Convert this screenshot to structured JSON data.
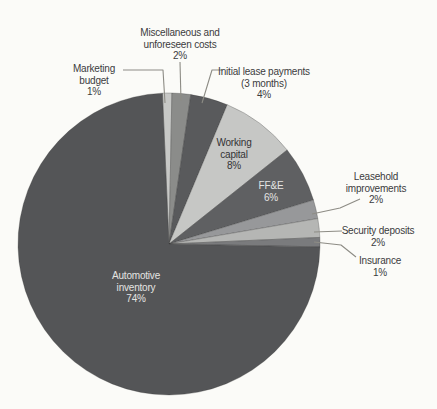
{
  "chart_data": {
    "type": "pie",
    "unit": "%",
    "start_angle_deg": -2.5,
    "direction": "clockwise",
    "total": 100,
    "slices": [
      {
        "name": "Marketing budget",
        "value": 1,
        "color": "#c7c8c6",
        "label_lines": [
          "Marketing",
          "budget",
          "1%"
        ]
      },
      {
        "name": "Miscellaneous and unforeseen costs",
        "value": 2,
        "color": "#8b8c8a",
        "label_lines": [
          "Miscellaneous and",
          "unforeseen costs",
          "2%"
        ]
      },
      {
        "name": "Initial lease payments (3 months)",
        "value": 4,
        "color": "#595a5c",
        "label_lines": [
          "Initial lease payments",
          "(3 months)",
          "4%"
        ]
      },
      {
        "name": "Working capital",
        "value": 8,
        "color": "#c6c7c5",
        "label_lines": [
          "Working",
          "capital",
          "8%"
        ]
      },
      {
        "name": "FF&E",
        "value": 6,
        "color": "#5f6062",
        "label_lines": [
          "FF&E",
          "6%"
        ]
      },
      {
        "name": "Leasehold improvements",
        "value": 2,
        "color": "#97989a",
        "label_lines": [
          "Leasehold",
          "improvements",
          "2%"
        ]
      },
      {
        "name": "Security deposits",
        "value": 2,
        "color": "#b5b6b4",
        "label_lines": [
          "Security deposits",
          "2%"
        ]
      },
      {
        "name": "Insurance",
        "value": 1,
        "color": "#7a7b7d",
        "label_lines": [
          "Insurance",
          "1%"
        ]
      },
      {
        "name": "Automotive inventory",
        "value": 74,
        "color": "#545557",
        "label_lines": [
          "Automotive",
          "inventory",
          "74%"
        ]
      }
    ]
  }
}
